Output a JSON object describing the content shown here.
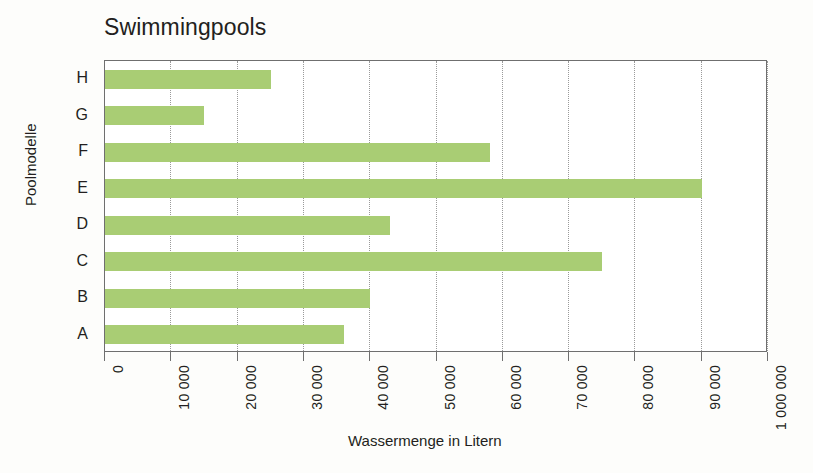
{
  "chart_data": {
    "type": "bar",
    "orientation": "horizontal",
    "title": "Swimmingpools",
    "xlabel": "Wassermenge in Litern",
    "ylabel": "Poolmodelle",
    "categories": [
      "A",
      "B",
      "C",
      "D",
      "E",
      "F",
      "G",
      "H"
    ],
    "values": [
      36000,
      40000,
      75000,
      43000,
      90000,
      58000,
      15000,
      25000
    ],
    "xlim": [
      0,
      100000
    ],
    "xticks": [
      0,
      10000,
      20000,
      30000,
      40000,
      50000,
      60000,
      70000,
      80000,
      90000,
      100000
    ],
    "xtick_labels": [
      "0",
      "10 000",
      "20 000",
      "30 000",
      "40 000",
      "50 000",
      "60 000",
      "70 000",
      "80 000",
      "90 000",
      "1 000 000"
    ],
    "grid": true,
    "legend": false,
    "bar_color": "#a9cd74",
    "frame_color": "#6f6f6f",
    "gridline_color": "#9a9a9a"
  }
}
